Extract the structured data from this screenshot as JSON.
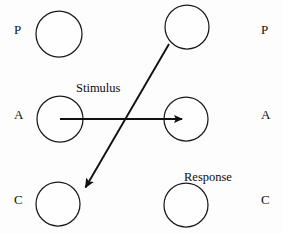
{
  "diagram": {
    "background_color": "#fdfdfd",
    "stroke_color": "#111111",
    "rows": [
      {
        "id": "P",
        "left_label": "P",
        "right_label": "P"
      },
      {
        "id": "A",
        "left_label": "A",
        "right_label": "A"
      },
      {
        "id": "C",
        "left_label": "C",
        "right_label": "C"
      }
    ],
    "nodes": [
      {
        "id": "left-parent",
        "label": "",
        "cx": 59,
        "cy": 34,
        "r": 23
      },
      {
        "id": "right-parent",
        "label": "",
        "cx": 187,
        "cy": 27,
        "r": 22
      },
      {
        "id": "left-adult",
        "label": "",
        "cx": 60,
        "cy": 119,
        "r": 23
      },
      {
        "id": "right-adult",
        "label": "",
        "cx": 186,
        "cy": 119,
        "r": 22
      },
      {
        "id": "left-child",
        "label": "",
        "cx": 58,
        "cy": 204,
        "r": 22
      },
      {
        "id": "right-child",
        "label": "",
        "cx": 186,
        "cy": 205,
        "r": 22
      }
    ],
    "arrows": [
      {
        "id": "stimulus-arrow",
        "label": "Stimulus",
        "from": "left-adult",
        "to": "right-adult",
        "x1": 60,
        "y1": 119,
        "x2": 188,
        "y2": 119
      },
      {
        "id": "response-arrow",
        "label": "Response",
        "from": "right-parent",
        "to": "left-child",
        "x1": 169,
        "y1": 44,
        "x2": 81,
        "y2": 194
      }
    ],
    "labels": {
      "stimulus": "Stimulus",
      "response": "Response"
    }
  }
}
